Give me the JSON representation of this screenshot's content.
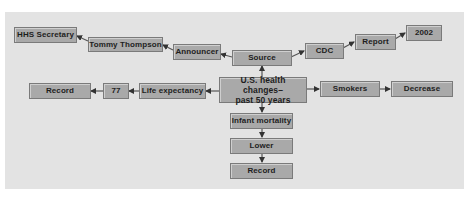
{
  "diagram": {
    "colors": {
      "background": "#e3e3e3",
      "box_fill": "#a9a9a9",
      "box_border": "#7a7a7a",
      "text": "#1e1e1e",
      "arrow": "#333333"
    },
    "nodes": {
      "center": {
        "line1": "U.S. health changes–",
        "line2": "past 50 years"
      },
      "source": "Source",
      "announcer": "Announcer",
      "tommy_thompson": "Tommy Thompson",
      "hhs_secretary": "HHS Secretary",
      "cdc": "CDC",
      "report": "Report",
      "year_2002": "2002",
      "life_expectancy": "Life expectancy",
      "value_77": "77",
      "record_left": "Record",
      "smokers": "Smokers",
      "decrease": "Decrease",
      "infant_mortality": "Infant mortality",
      "lower": "Lower",
      "record_bottom": "Record"
    },
    "edges": [
      {
        "from": "U.S. health changes–past 50 years",
        "to": "Source"
      },
      {
        "from": "Source",
        "to": "Announcer"
      },
      {
        "from": "Announcer",
        "to": "Tommy Thompson"
      },
      {
        "from": "Tommy Thompson",
        "to": "HHS Secretary"
      },
      {
        "from": "Source",
        "to": "CDC"
      },
      {
        "from": "CDC",
        "to": "Report"
      },
      {
        "from": "Report",
        "to": "2002"
      },
      {
        "from": "U.S. health changes–past 50 years",
        "to": "Life expectancy"
      },
      {
        "from": "Life expectancy",
        "to": "77"
      },
      {
        "from": "77",
        "to": "Record"
      },
      {
        "from": "U.S. health changes–past 50 years",
        "to": "Smokers"
      },
      {
        "from": "Smokers",
        "to": "Decrease"
      },
      {
        "from": "U.S. health changes–past 50 years",
        "to": "Infant mortality"
      },
      {
        "from": "Infant mortality",
        "to": "Lower"
      },
      {
        "from": "Lower",
        "to": "Record"
      }
    ]
  }
}
